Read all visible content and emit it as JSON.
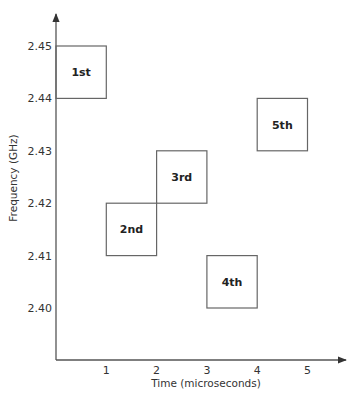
{
  "chart_data": {
    "type": "table",
    "title": "",
    "xlabel": "Time (microseconds)",
    "ylabel": "Frequency (GHz)",
    "x_ticks": [
      "1",
      "2",
      "3",
      "4",
      "5"
    ],
    "x_tick_values": [
      1,
      2,
      3,
      4,
      5
    ],
    "y_ticks": [
      "2.40",
      "2.41",
      "2.42",
      "2.43",
      "2.44",
      "2.45"
    ],
    "y_tick_values": [
      2.4,
      2.41,
      2.42,
      2.43,
      2.44,
      2.45
    ],
    "xlim": [
      0,
      5.7
    ],
    "ylim": [
      2.39,
      2.456
    ],
    "grid": false,
    "hops": [
      {
        "label": "1st",
        "time_start": 0,
        "time_end": 1,
        "freq_low": 2.44,
        "freq_high": 2.45
      },
      {
        "label": "2nd",
        "time_start": 1,
        "time_end": 2,
        "freq_low": 2.41,
        "freq_high": 2.42
      },
      {
        "label": "3rd",
        "time_start": 2,
        "time_end": 3,
        "freq_low": 2.42,
        "freq_high": 2.43
      },
      {
        "label": "4th",
        "time_start": 3,
        "time_end": 4,
        "freq_low": 2.4,
        "freq_high": 2.41
      },
      {
        "label": "5th",
        "time_start": 4,
        "time_end": 5,
        "freq_low": 2.43,
        "freq_high": 2.44
      }
    ]
  }
}
